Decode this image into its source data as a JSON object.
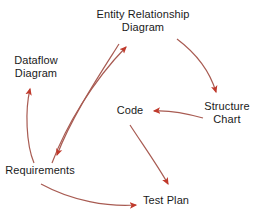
{
  "diagram": {
    "stroke_color": "#a85b52",
    "arrowhead_color": "#c0392b",
    "text_color": "#1a1a1a",
    "background": "#ffffff",
    "nodes": [
      {
        "id": "erd",
        "label": "Entity Relationship\nDiagram",
        "x": 143,
        "y": 21
      },
      {
        "id": "dataflow",
        "label": "Dataflow\nDiagram",
        "x": 36,
        "y": 67
      },
      {
        "id": "code",
        "label": "Code",
        "x": 130,
        "y": 111
      },
      {
        "id": "structure",
        "label": "Structure\nChart",
        "x": 227,
        "y": 113
      },
      {
        "id": "req",
        "label": "Requirements",
        "x": 40,
        "y": 171
      },
      {
        "id": "testplan",
        "label": "Test Plan",
        "x": 166,
        "y": 201
      }
    ],
    "edges": [
      {
        "id": "edge-req-to-erd",
        "from": "Requirements",
        "to": "Entity Relationship Diagram",
        "style": "curved"
      },
      {
        "id": "edge-erd-to-req",
        "from": "Entity Relationship Diagram",
        "to": "Requirements",
        "style": "curved"
      },
      {
        "id": "edge-erd-to-structure",
        "from": "Entity Relationship Diagram",
        "to": "Structure Chart",
        "style": "curved"
      },
      {
        "id": "edge-structure-to-code",
        "from": "Structure Chart",
        "to": "Code",
        "style": "curved"
      },
      {
        "id": "edge-req-to-dataflow",
        "from": "Requirements",
        "to": "Dataflow Diagram",
        "style": "curved"
      },
      {
        "id": "edge-code-to-testplan",
        "from": "Code",
        "to": "Test Plan",
        "style": "curved"
      },
      {
        "id": "edge-req-to-testplan",
        "from": "Requirements",
        "to": "Test Plan",
        "style": "curved"
      }
    ]
  }
}
